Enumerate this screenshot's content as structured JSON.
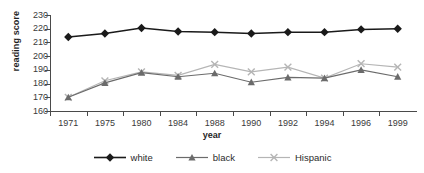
{
  "chart_data": {
    "type": "line",
    "title": "",
    "xlabel": "year",
    "ylabel": "reading score",
    "categories": [
      "1971",
      "1975",
      "1980",
      "1984",
      "1988",
      "1990",
      "1992",
      "1994",
      "1996",
      "1999"
    ],
    "ylim": [
      160,
      230
    ],
    "yticks": [
      160,
      170,
      180,
      190,
      200,
      210,
      220,
      230
    ],
    "grid": false,
    "legend_position": "bottom",
    "series": [
      {
        "name": "white",
        "marker": "diamond",
        "color": "#1a1a1a",
        "values": [
          214,
          216.5,
          220.5,
          218,
          217.5,
          216.5,
          217.5,
          217.5,
          219.5,
          220
        ]
      },
      {
        "name": "black",
        "marker": "triangle",
        "color": "#6b6b6b",
        "values": [
          170,
          180.5,
          188,
          185,
          187.5,
          181,
          184.5,
          184,
          190,
          185
        ]
      },
      {
        "name": "Hispanic",
        "marker": "x",
        "color": "#b5b5b5",
        "values": [
          170,
          182,
          188.5,
          186,
          194,
          188.5,
          192,
          184,
          194.5,
          192
        ]
      }
    ]
  },
  "axis": {
    "y_title": "reading score",
    "x_title": "year",
    "y_tick_labels": [
      "230",
      "220",
      "210",
      "200",
      "190",
      "180",
      "170",
      "160"
    ],
    "x_tick_labels": [
      "1971",
      "1975",
      "1980",
      "1984",
      "1988",
      "1990",
      "1992",
      "1994",
      "1996",
      "1999"
    ]
  },
  "legend": {
    "items": [
      {
        "label": "white",
        "marker": "diamond-marker",
        "color": "#1a1a1a"
      },
      {
        "label": "black",
        "marker": "triangle-marker",
        "color": "#6b6b6b"
      },
      {
        "label": "Hispanic",
        "marker": "x-marker",
        "color": "#b5b5b5"
      }
    ]
  }
}
